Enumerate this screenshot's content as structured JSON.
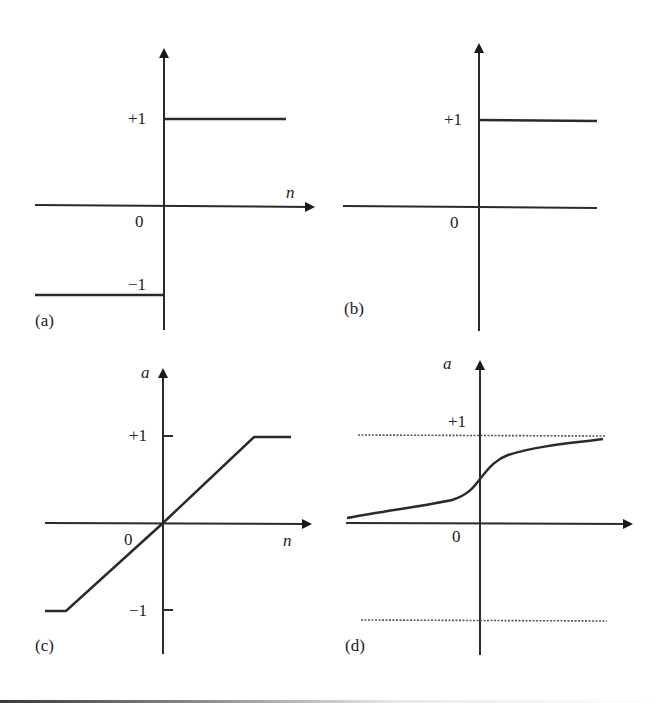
{
  "figure": {
    "panels": [
      {
        "id": "a",
        "caption": "(a)",
        "type": "hard-limit (symmetric)",
        "x_label": "n",
        "y_label": "",
        "origin_label": "0",
        "tick_labels": [
          "+1",
          "−1"
        ],
        "axis_x_arrow": true
      },
      {
        "id": "b",
        "caption": "(b)",
        "type": "hard-limit (step)",
        "x_label": "",
        "y_label": "",
        "origin_label": "0",
        "tick_labels": [
          "+1"
        ],
        "axis_x_arrow": false
      },
      {
        "id": "c",
        "caption": "(c)",
        "type": "saturating linear",
        "x_label": "n",
        "y_label": "a",
        "origin_label": "0",
        "tick_labels": [
          "+1",
          "−1"
        ],
        "axis_x_arrow": true
      },
      {
        "id": "d",
        "caption": "(d)",
        "type": "sigmoid with asymptotes",
        "x_label": "",
        "y_label": "a",
        "origin_label": "0",
        "tick_labels": [
          "+1"
        ],
        "axis_x_arrow": true
      }
    ],
    "colors": {
      "stroke": "#2a2a2a",
      "dotted": "#555555",
      "background": "#ffffff"
    }
  }
}
